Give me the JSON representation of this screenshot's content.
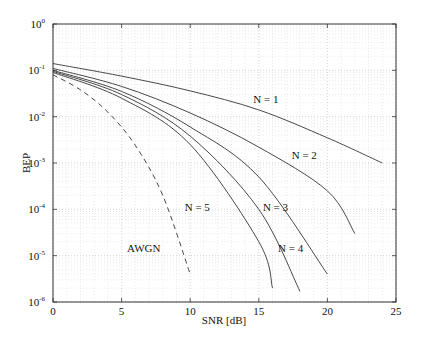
{
  "chart_data": {
    "type": "line",
    "title": "",
    "xlabel": "SNR [dB]",
    "ylabel": "BEP",
    "xlim": [
      0,
      25
    ],
    "ylim": [
      1e-06,
      1
    ],
    "yscale": "log",
    "grid": true,
    "xticks": [
      0,
      5,
      10,
      15,
      20,
      25
    ],
    "xtick_labels": [
      "0",
      "5",
      "10",
      "15",
      "20",
      "25"
    ],
    "yticks": [
      1,
      0.1,
      0.01,
      0.001,
      0.0001,
      1e-05,
      1e-06
    ],
    "ytick_labels": [
      {
        "base": "10",
        "exp": "0"
      },
      {
        "base": "10",
        "exp": "-1"
      },
      {
        "base": "10",
        "exp": "-2"
      },
      {
        "base": "10",
        "exp": "-3"
      },
      {
        "base": "10",
        "exp": "-4"
      },
      {
        "base": "10",
        "exp": "-5"
      },
      {
        "base": "10",
        "exp": "-6"
      }
    ],
    "series": [
      {
        "name": "N = 1",
        "style": "solid",
        "x": [
          0,
          5,
          10,
          15,
          20,
          24
        ],
        "values": [
          0.14,
          0.075,
          0.036,
          0.014,
          0.0035,
          0.001
        ],
        "label_pos": [
          14.6,
          0.02
        ]
      },
      {
        "name": "N = 2",
        "style": "solid",
        "x": [
          0,
          5,
          10,
          15,
          20,
          22
        ],
        "values": [
          0.11,
          0.045,
          0.012,
          0.0022,
          0.00025,
          3e-05
        ],
        "label_pos": [
          17.4,
          0.0012
        ]
      },
      {
        "name": "N = 3",
        "style": "solid",
        "x": [
          0,
          5,
          10,
          15,
          20
        ],
        "values": [
          0.1,
          0.035,
          0.006,
          0.0005,
          4e-06
        ],
        "label_pos": [
          15.3,
          9e-05
        ]
      },
      {
        "name": "N = 4",
        "style": "solid",
        "x": [
          0,
          5,
          10,
          15,
          18
        ],
        "values": [
          0.095,
          0.03,
          0.0038,
          0.0001,
          1.7e-06
        ],
        "label_pos": [
          16.4,
          1.2e-05
        ]
      },
      {
        "name": "N = 5",
        "style": "solid",
        "x": [
          0,
          5,
          10,
          15,
          16
        ],
        "values": [
          0.09,
          0.025,
          0.0025,
          2e-05,
          2e-06
        ],
        "label_pos": [
          9.6,
          9e-05
        ]
      },
      {
        "name": "AWGN",
        "style": "dashed",
        "x": [
          0,
          2,
          4,
          6,
          8,
          10
        ],
        "values": [
          0.08,
          0.038,
          0.0125,
          0.0024,
          0.0002,
          4e-06
        ],
        "label_pos": [
          5.4,
          1.2e-05
        ]
      }
    ]
  }
}
